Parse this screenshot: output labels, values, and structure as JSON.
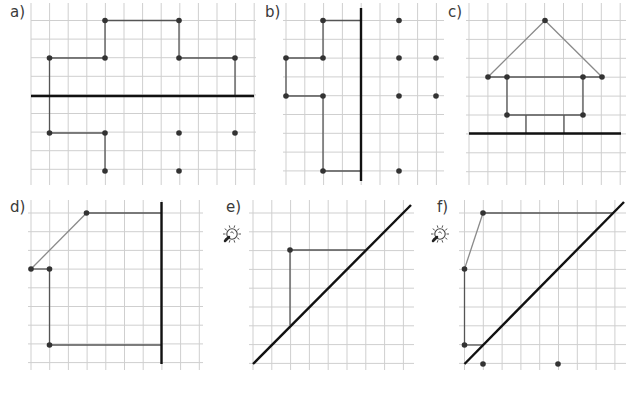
{
  "exercises": [
    {
      "id": "a",
      "label": "a)",
      "label_pos": [
        10,
        17
      ],
      "hint_icon": false,
      "grid": {
        "x0": 31,
        "x1": 256,
        "y0": 3,
        "y1": 185,
        "step": 18.6,
        "vx0": 31,
        "hy0": 20.5
      },
      "axis": {
        "type": "horizontal",
        "x1": 31,
        "y1": 96,
        "x2": 254,
        "y2": 96
      },
      "segments": [
        {
          "x1": 105,
          "y1": 20.5,
          "x2": 179,
          "y2": 20.5,
          "style": "dark"
        },
        {
          "x1": 105,
          "y1": 20.5,
          "x2": 105,
          "y2": 58,
          "style": "dark"
        },
        {
          "x1": 179,
          "y1": 20.5,
          "x2": 179,
          "y2": 58,
          "style": "dark"
        },
        {
          "x1": 49.5,
          "y1": 58,
          "x2": 105,
          "y2": 58,
          "style": "dark"
        },
        {
          "x1": 179,
          "y1": 58,
          "x2": 235,
          "y2": 58,
          "style": "dark"
        },
        {
          "x1": 49.5,
          "y1": 58,
          "x2": 49.5,
          "y2": 133,
          "style": "dark"
        },
        {
          "x1": 235,
          "y1": 58,
          "x2": 235,
          "y2": 96,
          "style": "dark"
        },
        {
          "x1": 49.5,
          "y1": 133,
          "x2": 105,
          "y2": 133,
          "style": "dark"
        },
        {
          "x1": 105,
          "y1": 133,
          "x2": 105,
          "y2": 171,
          "style": "dark"
        }
      ],
      "points": [
        [
          105,
          20.5
        ],
        [
          179,
          20.5
        ],
        [
          49.5,
          58
        ],
        [
          105,
          58
        ],
        [
          179,
          58
        ],
        [
          235,
          58
        ],
        [
          49.5,
          133
        ],
        [
          105,
          133
        ],
        [
          179,
          133
        ],
        [
          235,
          133
        ],
        [
          105,
          171
        ],
        [
          179,
          171
        ]
      ]
    },
    {
      "id": "b",
      "label": "b)",
      "label_pos": [
        265,
        17
      ],
      "hint_icon": false,
      "grid": {
        "x0": 283,
        "x1": 444,
        "y0": 3,
        "y1": 185,
        "step": 18.8,
        "vx0": 286,
        "hy0": 20.5
      },
      "axis": {
        "type": "vertical",
        "x1": 361,
        "y1": 8,
        "x2": 361,
        "y2": 181
      },
      "segments": [
        {
          "x1": 323,
          "y1": 20.5,
          "x2": 361,
          "y2": 20.5,
          "style": "dark"
        },
        {
          "x1": 323,
          "y1": 20.5,
          "x2": 323,
          "y2": 58,
          "style": "dark"
        },
        {
          "x1": 286,
          "y1": 58,
          "x2": 323,
          "y2": 58,
          "style": "dark"
        },
        {
          "x1": 286,
          "y1": 58,
          "x2": 286,
          "y2": 96,
          "style": "dark"
        },
        {
          "x1": 286,
          "y1": 96,
          "x2": 323,
          "y2": 96,
          "style": "dark"
        },
        {
          "x1": 323,
          "y1": 96,
          "x2": 323,
          "y2": 171,
          "style": "dark"
        },
        {
          "x1": 323,
          "y1": 171,
          "x2": 361,
          "y2": 171,
          "style": "dark"
        }
      ],
      "points": [
        [
          323,
          20.5
        ],
        [
          286,
          58
        ],
        [
          323,
          58
        ],
        [
          286,
          96
        ],
        [
          323,
          96
        ],
        [
          323,
          171
        ],
        [
          399,
          20.5
        ],
        [
          399,
          58
        ],
        [
          436,
          58
        ],
        [
          399,
          96
        ],
        [
          436,
          96
        ],
        [
          399,
          171
        ]
      ]
    },
    {
      "id": "c",
      "label": "c)",
      "label_pos": [
        448,
        17
      ],
      "hint_icon": false,
      "grid": {
        "x0": 466,
        "x1": 626,
        "y0": 3,
        "y1": 185,
        "step": 18.9,
        "vx0": 469,
        "hy0": 20.5
      },
      "axis": {
        "type": "horizontal",
        "x1": 469,
        "y1": 133.5,
        "x2": 621,
        "y2": 133.5
      },
      "segments": [
        {
          "x1": 488,
          "y1": 77,
          "x2": 545,
          "y2": 20.5,
          "style": "light"
        },
        {
          "x1": 545,
          "y1": 20.5,
          "x2": 602,
          "y2": 77,
          "style": "light"
        },
        {
          "x1": 488,
          "y1": 77,
          "x2": 602,
          "y2": 77,
          "style": "dark"
        },
        {
          "x1": 507,
          "y1": 77,
          "x2": 507,
          "y2": 115,
          "style": "dark"
        },
        {
          "x1": 583,
          "y1": 77,
          "x2": 583,
          "y2": 115,
          "style": "dark"
        },
        {
          "x1": 507,
          "y1": 115,
          "x2": 583,
          "y2": 115,
          "style": "dark"
        },
        {
          "x1": 526,
          "y1": 115,
          "x2": 526,
          "y2": 133.5,
          "style": "dark"
        },
        {
          "x1": 564,
          "y1": 115,
          "x2": 564,
          "y2": 133.5,
          "style": "dark"
        }
      ],
      "points": [
        [
          545,
          20.5
        ],
        [
          488,
          77
        ],
        [
          507,
          77
        ],
        [
          583,
          77
        ],
        [
          602,
          77
        ],
        [
          507,
          115
        ],
        [
          583,
          115
        ]
      ]
    },
    {
      "id": "d",
      "label": "d)",
      "label_pos": [
        10,
        212
      ],
      "hint_icon": false,
      "grid": {
        "x0": 28,
        "x1": 203,
        "y0": 200,
        "y1": 370,
        "step": 18.7,
        "vx0": 31,
        "hy0": 213
      },
      "axis": {
        "type": "vertical",
        "x1": 161.5,
        "y1": 202,
        "x2": 161.5,
        "y2": 364
      },
      "segments": [
        {
          "x1": 86.5,
          "y1": 213,
          "x2": 161.5,
          "y2": 213,
          "style": "dark"
        },
        {
          "x1": 86.5,
          "y1": 213,
          "x2": 31,
          "y2": 269,
          "style": "light"
        },
        {
          "x1": 31,
          "y1": 269,
          "x2": 49.5,
          "y2": 269,
          "style": "dark"
        },
        {
          "x1": 49.5,
          "y1": 269,
          "x2": 49.5,
          "y2": 345,
          "style": "dark"
        },
        {
          "x1": 49.5,
          "y1": 345,
          "x2": 161.5,
          "y2": 345,
          "style": "dark"
        }
      ],
      "points": [
        [
          86.5,
          213
        ],
        [
          31,
          269
        ],
        [
          49.5,
          269
        ],
        [
          49.5,
          345
        ]
      ]
    },
    {
      "id": "e",
      "label": "e)",
      "label_pos": [
        226,
        212
      ],
      "hint_icon": true,
      "hint_icon_pos": [
        232,
        234
      ],
      "grid": {
        "x0": 249,
        "x1": 414,
        "y0": 200,
        "y1": 370,
        "step": 18.8,
        "vx0": 253,
        "hy0": 213
      },
      "axis": {
        "type": "diagonal",
        "x1": 253,
        "y1": 364,
        "x2": 411,
        "y2": 205
      },
      "segments": [
        {
          "x1": 290,
          "y1": 250,
          "x2": 365,
          "y2": 250,
          "style": "dark"
        },
        {
          "x1": 290,
          "y1": 250,
          "x2": 290,
          "y2": 325,
          "style": "dark"
        }
      ],
      "points": [
        [
          290,
          250
        ]
      ]
    },
    {
      "id": "f",
      "label": "f)",
      "label_pos": [
        437,
        212
      ],
      "hint_icon": true,
      "hint_icon_pos": [
        440,
        234
      ],
      "grid": {
        "x0": 459,
        "x1": 626,
        "y0": 200,
        "y1": 370,
        "step": 18.8,
        "vx0": 464.5,
        "hy0": 213
      },
      "axis": {
        "type": "diagonal",
        "x1": 464.5,
        "y1": 364,
        "x2": 624,
        "y2": 202
      },
      "segments": [
        {
          "x1": 483,
          "y1": 213,
          "x2": 614,
          "y2": 213,
          "style": "dark"
        },
        {
          "x1": 483,
          "y1": 213,
          "x2": 464.5,
          "y2": 269,
          "style": "light"
        },
        {
          "x1": 464.5,
          "y1": 269,
          "x2": 464.5,
          "y2": 345,
          "style": "dark"
        },
        {
          "x1": 464.5,
          "y1": 345,
          "x2": 483,
          "y2": 345,
          "style": "dark"
        }
      ],
      "points": [
        [
          483,
          213
        ],
        [
          464.5,
          269
        ],
        [
          464.5,
          345
        ],
        [
          483,
          364
        ],
        [
          558,
          364
        ]
      ]
    }
  ],
  "hint_icon_name": "lightbulb-hint-icon"
}
